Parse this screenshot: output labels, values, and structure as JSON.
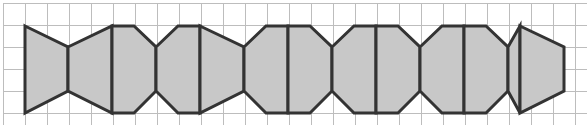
{
  "figure": {
    "width": 588,
    "height": 127,
    "background_color": "#ffffff"
  },
  "grid": {
    "line_color": "#bdbdbd",
    "line_width": 1,
    "cell_size": 22,
    "origin_x": 3,
    "origin_y": 3,
    "columns": 27,
    "rows": 6,
    "extent_x_start": 3,
    "extent_x_end": 587,
    "extent_y_start": 3,
    "extent_y_end": 125
  },
  "tiles": {
    "fill_color": "#c8c8c8",
    "stroke_color": "#333333",
    "stroke_width": 3,
    "count": 13,
    "band_top_y": 26,
    "band_bottom_y": 113,
    "waist_top_y": 47,
    "waist_bottom_y": 91,
    "module_width": 44,
    "description": "Alternating up-peak and down-waist vertices create interlocking hexagons and bowties",
    "vertex_x_sequence": [
      25,
      68,
      112,
      134,
      178,
      200,
      244,
      266,
      310,
      332,
      376,
      398,
      442,
      464,
      508,
      520,
      564
    ],
    "polygons": [
      {
        "name": "tile-1-bowtie-left",
        "points": "25,26 68,47 68,91 25,113"
      },
      {
        "name": "tile-2-bowtie-right",
        "points": "68,47 112,26 112,113 68,91"
      },
      {
        "name": "tile-3-hex-left",
        "points": "112,26 134,26 156,47 156,91 134,113 112,113"
      },
      {
        "name": "tile-4-hex-right",
        "points": "156,47 178,26 200,26 200,113 178,113 156,91"
      },
      {
        "name": "tile-5-bowtie-left",
        "points": "200,26 244,47 244,91 200,113"
      },
      {
        "name": "tile-6-bowtie-right",
        "points": "244,47 266,26 288,26 288,113 266,113 244,91"
      },
      {
        "name": "tile-7-hex-left",
        "points": "288,26 310,26 332,47 332,91 310,113 288,113"
      },
      {
        "name": "tile-8-hex-right",
        "points": "332,47 354,26 376,26 376,113 354,113 332,91"
      },
      {
        "name": "tile-9-bowtie-left",
        "points": "376,26 398,26 420,47 420,91 398,113 376,113"
      },
      {
        "name": "tile-10-bowtie-right",
        "points": "420,47 442,26 464,26 464,113 442,113 420,91"
      },
      {
        "name": "tile-11-hex-left",
        "points": "464,26 486,26 508,47 508,91 486,113 464,113"
      },
      {
        "name": "tile-12-hex-right",
        "points": "508,47 520,26 520,113 508,91"
      },
      {
        "name": "tile-13-bowtie-end",
        "points": "520,26 564,47 564,91 520,113"
      }
    ]
  }
}
